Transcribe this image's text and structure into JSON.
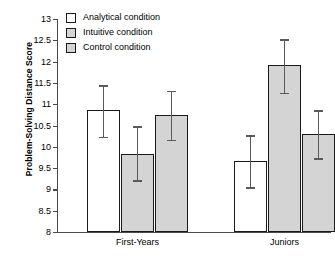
{
  "chart_data": {
    "type": "bar",
    "title": "",
    "xlabel": "",
    "ylabel": "Problem-Solving Distance Score",
    "ylim": [
      8,
      13
    ],
    "yticks": [
      "8",
      "8.5",
      "9",
      "9.5",
      "10",
      "10.5",
      "11",
      "11.5",
      "12",
      "12.5",
      "13"
    ],
    "grid": false,
    "legend_position": "top-left",
    "categories": [
      "First-Years",
      "Juniors"
    ],
    "series": [
      {
        "name": "Analytical condition",
        "fill": "#ffffff",
        "values": [
          10.86,
          9.66
        ],
        "err_low": [
          10.24,
          9.05
        ],
        "err_high": [
          11.45,
          10.27
        ]
      },
      {
        "name": "Intuitive condition",
        "fill": "#d4d4d4",
        "values": [
          9.84,
          11.92
        ],
        "err_low": [
          9.21,
          11.27
        ],
        "err_high": [
          10.48,
          12.52
        ]
      },
      {
        "name": "Control condition",
        "fill": "#d4d4d4",
        "values": [
          10.74,
          10.3
        ],
        "err_low": [
          10.17,
          9.73
        ],
        "err_high": [
          11.32,
          10.86
        ]
      }
    ]
  },
  "legend": {
    "items": [
      {
        "label": "Analytical condition",
        "style": "white"
      },
      {
        "label": "Intuitive condition",
        "style": "gray"
      },
      {
        "label": "Control condition",
        "style": "gray"
      }
    ]
  }
}
